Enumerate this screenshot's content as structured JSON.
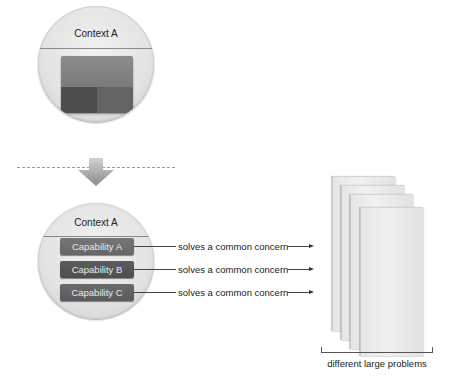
{
  "diagram": {
    "top_circle": {
      "title": "Context A",
      "block_colors": {
        "top": "#838383",
        "bottom_left": "#4e4e4e",
        "bottom_right": "#636363"
      }
    },
    "transition": {
      "separator": "dashed-line",
      "arrow": "down-arrow-icon"
    },
    "bottom_circle": {
      "title": "Context A",
      "capabilities": [
        {
          "label": "Capability A",
          "relation": "solves a common concern"
        },
        {
          "label": "Capability B",
          "relation": "solves a common concern"
        },
        {
          "label": "Capability C",
          "relation": "solves a common concern"
        }
      ]
    },
    "problems": {
      "card_count": 4,
      "label": "different large problems"
    }
  }
}
